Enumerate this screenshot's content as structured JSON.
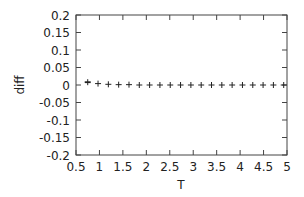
{
  "chart_data": {
    "type": "scatter",
    "title": "",
    "xlabel": "T",
    "ylabel": "diff",
    "xlim": [
      0.5,
      5
    ],
    "ylim": [
      -0.2,
      0.2
    ],
    "xticks": [
      "0.5",
      "1",
      "1.5",
      "2",
      "2.5",
      "3",
      "3.5",
      "4",
      "4.5",
      "5"
    ],
    "yticks": [
      "0.2",
      "0.15",
      "0.1",
      "0.05",
      "0",
      "-0.05",
      "-0.1",
      "-0.15",
      "-0.2"
    ],
    "grid": false,
    "legend": null,
    "marker": "+",
    "series": [
      {
        "name": "diff",
        "x": [
          0.75,
          0.97,
          1.19,
          1.41,
          1.63,
          1.85,
          2.07,
          2.29,
          2.51,
          2.73,
          2.95,
          3.17,
          3.39,
          3.61,
          3.83,
          4.05,
          4.27,
          4.49,
          4.71,
          4.93
        ],
        "y": [
          0.008,
          0.004,
          0.002,
          0.001,
          0.001,
          0,
          0,
          0,
          0,
          0,
          0,
          0,
          0,
          0,
          0,
          0,
          0,
          0,
          0,
          0
        ]
      }
    ]
  }
}
